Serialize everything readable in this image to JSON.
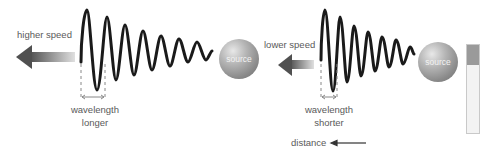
{
  "left_scene": {
    "speed_label": "higher speed",
    "source_label": "source",
    "wavelength_label": "wavelength",
    "wavelength_qualifier": "longer"
  },
  "right_scene": {
    "speed_label": "lower  speed",
    "source_label": "source",
    "wavelength_label": "wavelength",
    "wavelength_qualifier": "shorter"
  },
  "axis": {
    "distance_label": "distance"
  },
  "icons": {
    "arrow": "arrow-left-icon",
    "sphere": "source-sphere-icon"
  },
  "colors": {
    "wave": "#1a1a1a",
    "arrow_dark": "#555555",
    "text": "#5a5a5a"
  }
}
